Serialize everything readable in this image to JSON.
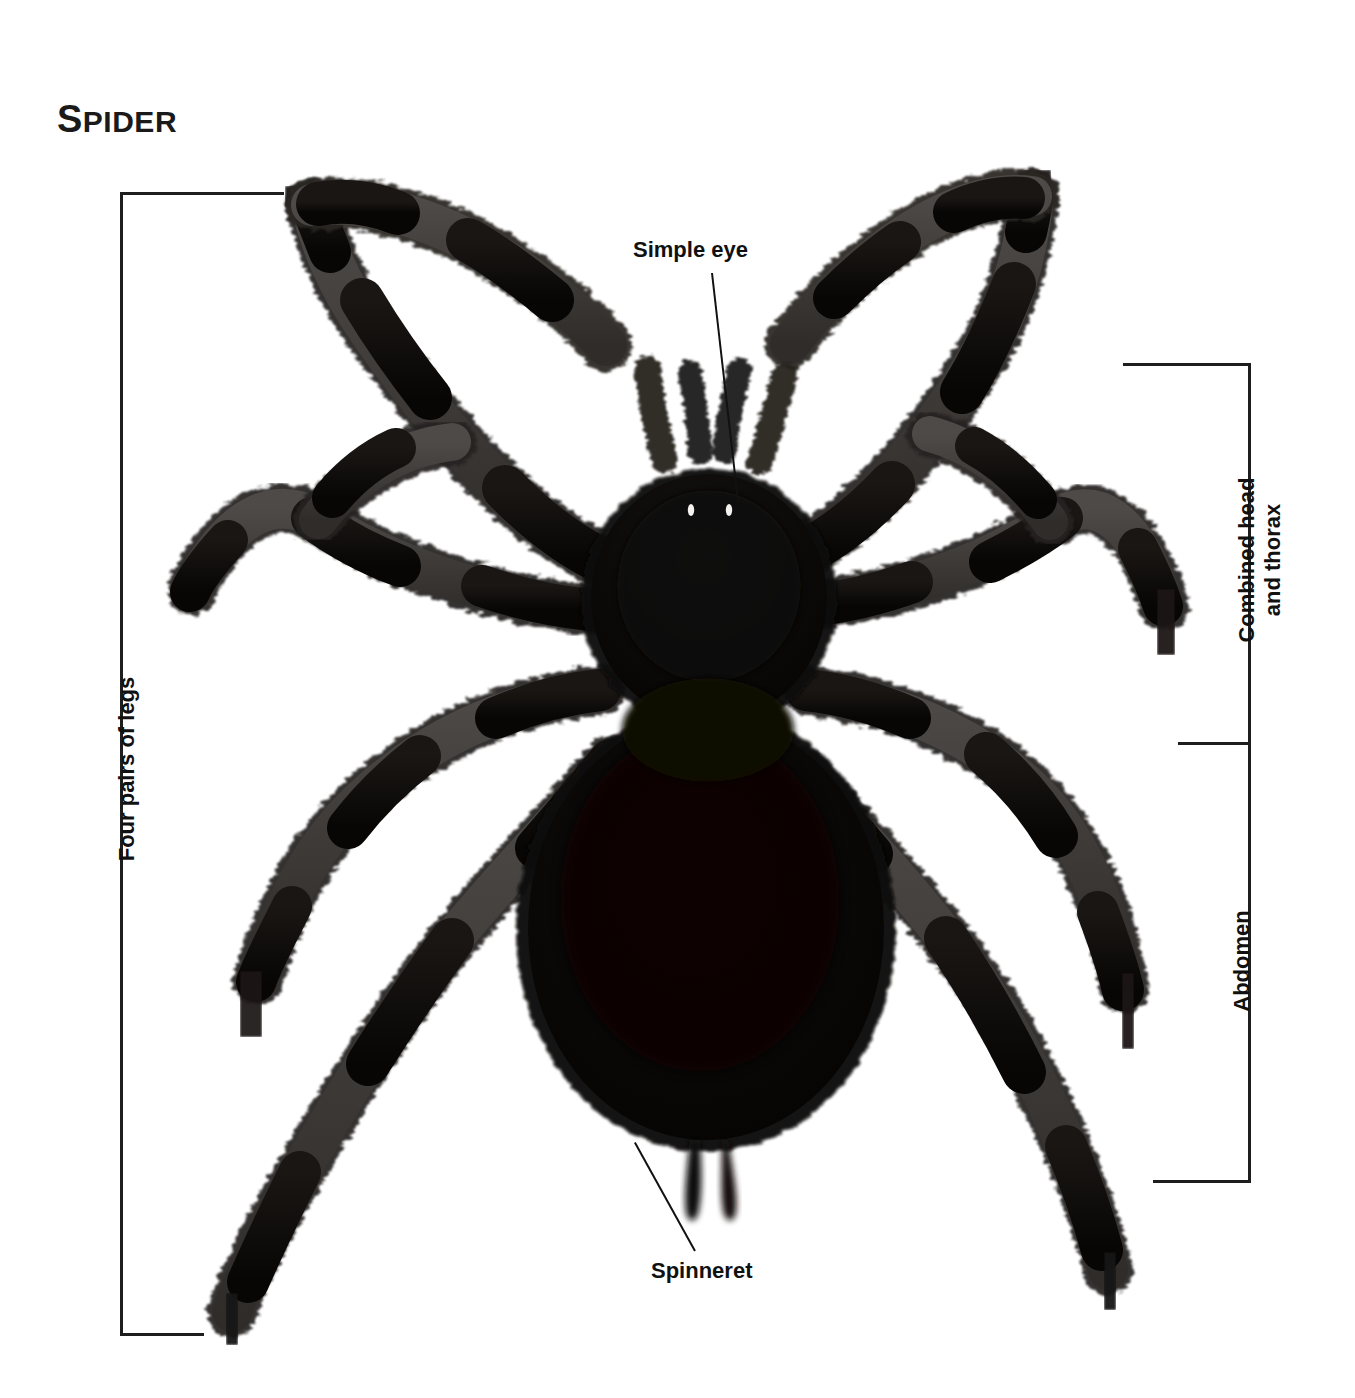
{
  "figure": {
    "title_first_letter": "S",
    "title_rest": "PIDER",
    "title_full": "SPIDER",
    "background_color": "#ffffff",
    "ink_color": "#1a1a1a",
    "width": 1355,
    "height": 1398
  },
  "labels": {
    "simple_eye": "Simple eye",
    "spinneret": "Spinneret",
    "four_pairs_of_legs": "Four pairs of legs",
    "combined_head_line1": "Combined head",
    "combined_head_line2": "and thorax",
    "abdomen": "Abdomen"
  },
  "subject": {
    "common_name": "Spider",
    "body_regions": [
      "Combined head and thorax",
      "Abdomen"
    ],
    "appendages": {
      "legs": "Four pairs of legs",
      "leg_count": 8,
      "pedipalp_count": 2,
      "spinneret_count": 2,
      "eye_highlight_count": 2
    }
  },
  "annotations": [
    {
      "id": "four-pairs-of-legs",
      "text": "Four pairs of legs",
      "type": "bracket",
      "side": "left",
      "orientation": "vertical",
      "rotated": true
    },
    {
      "id": "simple-eye",
      "text": "Simple eye",
      "type": "leader-line",
      "side": "top",
      "orientation": "horizontal",
      "rotated": false
    },
    {
      "id": "combined-head-and-thorax",
      "text": "Combined head and thorax",
      "type": "bracket",
      "side": "right",
      "orientation": "vertical",
      "rotated": true
    },
    {
      "id": "abdomen",
      "text": "Abdomen",
      "type": "bracket",
      "side": "right",
      "orientation": "vertical",
      "rotated": true
    },
    {
      "id": "spinneret",
      "text": "Spinneret",
      "type": "leader-line",
      "side": "bottom",
      "orientation": "diagonal",
      "rotated": false
    }
  ]
}
